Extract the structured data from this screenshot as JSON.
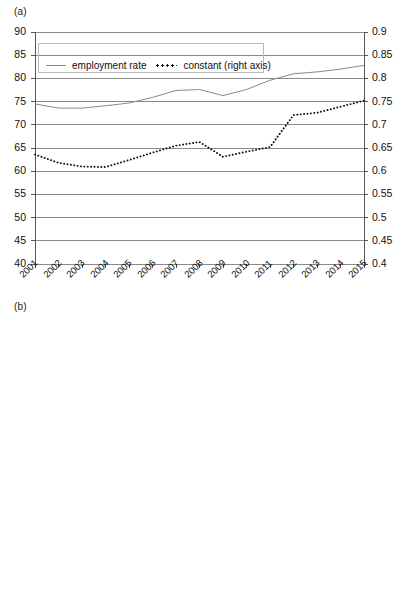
{
  "figure": {
    "panels": [
      {
        "label": "(a)"
      },
      {
        "label": "(b)"
      }
    ]
  },
  "legend": {
    "series_solid": "employment rate",
    "series_dotted": "constant (right axis)"
  },
  "axes": {
    "left_ticks": [
      "90",
      "85",
      "80",
      "75",
      "70",
      "65",
      "60",
      "55",
      "50",
      "45",
      "40"
    ],
    "right_ticks": [
      "0.9",
      "0.85",
      "0.8",
      "0.75",
      "0.7",
      "0.65",
      "0.6",
      "0.55",
      "0.5",
      "0.45",
      "0.4"
    ],
    "x_ticks": [
      "2001",
      "2002",
      "2003",
      "2004",
      "2005",
      "2006",
      "2007",
      "2008",
      "2009",
      "2010",
      "2011",
      "2012",
      "2013",
      "2014",
      "2015"
    ]
  },
  "colors": {
    "line_solid": "#8a8a8a",
    "line_dotted": "#111111",
    "grid": "#7d7d7d",
    "axis": "#555555",
    "legend_border": "#b9b9b9",
    "background": "#ffffff"
  },
  "chart_data": [
    {
      "type": "line",
      "panel": "(a)",
      "title": "",
      "xlabel": "",
      "ylabel": "",
      "ylim": [
        40,
        90
      ],
      "y2lim": [
        0.4,
        0.9
      ],
      "grid": true,
      "legend_position": "top-left-inside",
      "x": [
        2001,
        2002,
        2003,
        2004,
        2005,
        2006,
        2007,
        2008,
        2009,
        2010,
        2011,
        2012,
        2013,
        2014,
        2015
      ],
      "series": [
        {
          "name": "employment rate",
          "axis": "left",
          "style": "solid",
          "values": [
            74.5,
            73.6,
            73.6,
            74.1,
            74.7,
            75.9,
            77.4,
            77.6,
            76.3,
            77.6,
            79.6,
            81.0,
            81.4,
            82.0,
            82.8
          ]
        },
        {
          "name": "constant (right axis)",
          "axis": "right",
          "style": "dotted",
          "values": [
            0.636,
            0.618,
            0.61,
            0.609,
            0.624,
            0.64,
            0.655,
            0.663,
            0.631,
            0.642,
            0.652,
            0.721,
            0.726,
            0.739,
            0.752
          ]
        }
      ]
    },
    {
      "type": "line",
      "panel": "(b)",
      "title": "",
      "xlabel": "",
      "ylabel": "",
      "ylim": [
        40,
        90
      ],
      "y2lim": [
        0.4,
        0.9
      ],
      "grid": true,
      "legend_position": "top-left-inside",
      "x": [
        2001,
        2002,
        2003,
        2004,
        2005,
        2006,
        2007,
        2008,
        2009,
        2010,
        2011,
        2012,
        2013,
        2014,
        2015
      ],
      "series": [
        {
          "name": "employment rate",
          "axis": "left",
          "style": "solid",
          "values": [
            59.4,
            59.3,
            59.3,
            59.9,
            61.0,
            62.2,
            63.4,
            64.6,
            65.2,
            65.9,
            67.2,
            70.2,
            71.2,
            72.3,
            72.3
          ]
        },
        {
          "name": "constant (right axis)",
          "axis": "right",
          "style": "dotted",
          "values": [
            0.585,
            0.574,
            0.573,
            0.58,
            0.601,
            0.601,
            0.603,
            0.639,
            0.622,
            0.636,
            0.65,
            0.703,
            0.717,
            0.725,
            0.717
          ]
        }
      ]
    }
  ]
}
